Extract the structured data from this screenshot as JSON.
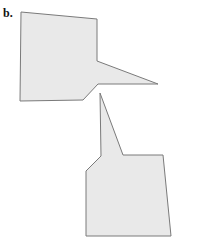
{
  "figure": {
    "label": "b.",
    "fill_color": "#e9e9e9",
    "stroke_color": "#7a7a7a",
    "shapes": [
      {
        "name": "upper-polygon",
        "points": "21,12 97,19 97,61 158,84 98,84 83,100 20,101"
      },
      {
        "name": "lower-polygon",
        "points": "100,93 123,155 163,155 171,236 86,236 86,171 101,156"
      }
    ]
  }
}
